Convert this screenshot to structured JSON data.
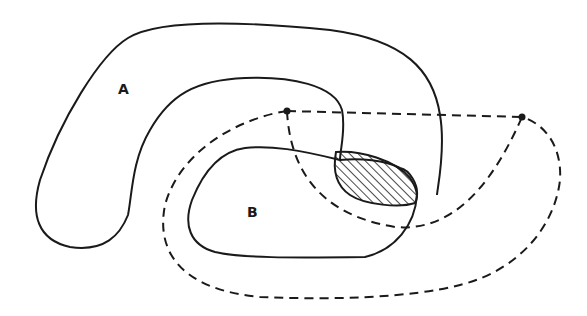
{
  "diagram": {
    "type": "set-overlap",
    "colors": {
      "stroke": "#1a1a1a",
      "background": "#ffffff"
    },
    "regions": [
      {
        "id": "A",
        "label": "A",
        "style": "solid",
        "shape": "horseshoe"
      },
      {
        "id": "B",
        "label": "B",
        "style": "solid",
        "shape": "closed-loop"
      },
      {
        "id": "C",
        "label": "",
        "style": "dashed",
        "shape": "closed-loop with two anchor points"
      }
    ],
    "anchor_points": [
      {
        "name": "left-anchor",
        "x": 287,
        "y": 111
      },
      {
        "name": "right-anchor",
        "x": 522,
        "y": 117
      }
    ],
    "intersection": {
      "regions": [
        "A",
        "B"
      ],
      "fill": "hatched"
    }
  }
}
